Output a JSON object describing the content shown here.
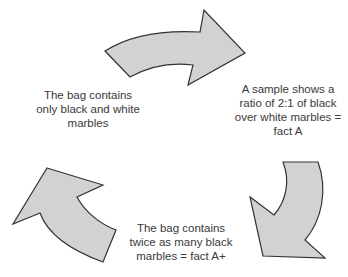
{
  "diagram": {
    "type": "cycle",
    "colors": {
      "arrow_fill": "#d2d2d2",
      "arrow_stroke": "#333333",
      "text": "#3a3a3a"
    },
    "nodes": [
      {
        "id": "left",
        "lines": [
          "The bag contains",
          "only black and white",
          "marbles"
        ]
      },
      {
        "id": "right",
        "lines": [
          "A sample shows a",
          "ratio of 2:1 of black",
          "over white marbles =",
          "fact A"
        ]
      },
      {
        "id": "bottom",
        "lines": [
          "The bag contains",
          "twice as many black",
          "marbles = fact A+"
        ]
      }
    ],
    "arrows": [
      {
        "id": "top-arrow",
        "direction": "left-to-right"
      },
      {
        "id": "right-arrow",
        "direction": "down"
      },
      {
        "id": "left-arrow",
        "direction": "up"
      }
    ]
  }
}
